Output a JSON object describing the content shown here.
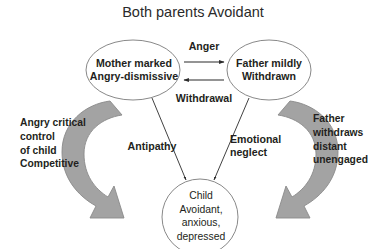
{
  "diagram": {
    "title": "Both parents Avoidant",
    "type": "relationship-cycle-diagram",
    "background_color": "#ffffff",
    "text_color": "#231f20",
    "arrow_fill_color": "#a3a3a3",
    "arrow_stroke_color": "#8a8a8a",
    "ellipse_stroke_color": "#7a7a7a",
    "nodes": [
      {
        "id": "mother",
        "label": "Mother marked\nAngry-dismissive",
        "shape": "ellipse",
        "bold": true
      },
      {
        "id": "father",
        "label": "Father mildly\nWithdrawn",
        "shape": "ellipse",
        "bold": true
      },
      {
        "id": "child",
        "label": "Child\nAvoidant,\nanxious,\ndepressed",
        "shape": "ellipse",
        "bold": false
      }
    ],
    "edges": [
      {
        "id": "anger",
        "label": "Anger",
        "from": "mother",
        "to": "father",
        "direction": "right"
      },
      {
        "id": "withdrawal",
        "label": "Withdrawal",
        "from": "father",
        "to": "mother",
        "direction": "left"
      },
      {
        "id": "antipathy",
        "label": "Antipathy",
        "from": "mother",
        "to": "child",
        "direction": "down-right"
      },
      {
        "id": "emotional-neglect",
        "label": "Emotional\nneglect",
        "from": "father",
        "to": "child",
        "direction": "down-left"
      }
    ],
    "side_labels": [
      {
        "id": "left",
        "label": "Angry critical\ncontrol\nof child\nCompetitive"
      },
      {
        "id": "right",
        "label": "Father\nwithdraws\ndistant\nunengaged"
      }
    ],
    "curved_arrows": [
      {
        "id": "left-curved-arrow",
        "from": "mother",
        "to": "child",
        "sweep": "counter-clockwise"
      },
      {
        "id": "right-curved-arrow",
        "from": "father",
        "to": "child",
        "sweep": "clockwise"
      }
    ]
  }
}
